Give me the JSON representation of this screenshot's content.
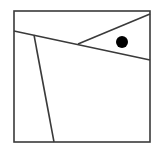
{
  "diagram": {
    "canvas": {
      "width": 164,
      "height": 150,
      "background": "#ffffff"
    },
    "stroke_color": "#3a3a3a",
    "fill_color": "#000000",
    "square": {
      "x": 14,
      "y": 11,
      "width": 136,
      "height": 131
    },
    "lines": [
      {
        "name": "long-diagonal",
        "x1": 14,
        "y1": 31,
        "x2": 150,
        "y2": 60
      },
      {
        "name": "upper-diagonal",
        "x1": 78,
        "y1": 44,
        "x2": 150,
        "y2": 14
      },
      {
        "name": "near-vertical",
        "x1": 34,
        "y1": 35,
        "x2": 54,
        "y2": 142
      }
    ],
    "dot": {
      "cx": 122,
      "cy": 42,
      "r": 6
    }
  }
}
